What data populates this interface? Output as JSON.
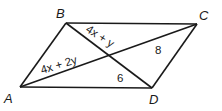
{
  "figure": {
    "type": "parallelogram with diagonals",
    "vertices": [
      {
        "name": "A",
        "x": 20,
        "y": 87,
        "label_x": 4,
        "label_y": 103
      },
      {
        "name": "B",
        "x": 66,
        "y": 23,
        "label_x": 56,
        "label_y": 18
      },
      {
        "name": "C",
        "x": 197,
        "y": 24,
        "label_x": 199,
        "label_y": 20
      },
      {
        "name": "D",
        "x": 152,
        "y": 88,
        "label_x": 149,
        "label_y": 104
      }
    ],
    "segment_labels": [
      {
        "id": "BE",
        "text": "4x + y",
        "x": 86,
        "y": 32,
        "angle": 31
      },
      {
        "id": "AE",
        "text": "4x + 2y",
        "x": 42,
        "y": 73,
        "angle": -17
      },
      {
        "id": "CE",
        "text": "8",
        "x": 155,
        "y": 53,
        "angle": 0
      },
      {
        "id": "DE",
        "text": "6",
        "x": 116,
        "y": 81,
        "angle": 0
      }
    ],
    "stroke_color": "#1a1a1a"
  }
}
